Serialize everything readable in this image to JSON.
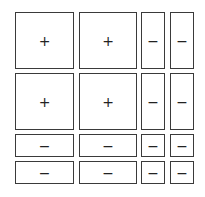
{
  "diagram": {
    "title": "",
    "grid": {
      "columns_x": [
        [
          15,
          74
        ],
        [
          79,
          137
        ],
        [
          141,
          165
        ],
        [
          170,
          194
        ]
      ],
      "rows_y": [
        [
          12,
          69
        ],
        [
          73,
          130
        ],
        [
          134,
          157
        ],
        [
          161,
          184
        ]
      ],
      "cells": [
        [
          "+",
          "+",
          "−",
          "−"
        ],
        [
          "+",
          "+",
          "−",
          "−"
        ],
        [
          "−",
          "−",
          "−",
          "−"
        ],
        [
          "−",
          "−",
          "−",
          "−"
        ]
      ]
    },
    "colors": {
      "border": "#3a3a3a",
      "background": "#ffffff",
      "sign": "#222222"
    }
  }
}
